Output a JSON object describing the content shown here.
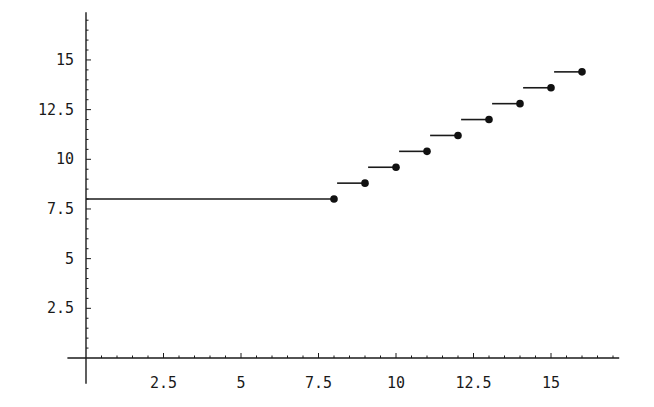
{
  "chart_data": {
    "type": "line",
    "title": "",
    "xlabel": "",
    "ylabel": "",
    "xlim": [
      -0.6,
      17.2
    ],
    "ylim": [
      -1.3,
      17.4
    ],
    "grid": false,
    "legend": null,
    "x_ticks": [
      "2.5",
      "5",
      "7.5",
      "10",
      "12.5",
      "15"
    ],
    "y_ticks": [
      "2.5",
      "5",
      "7.5",
      "10",
      "12.5",
      "15"
    ],
    "series": [
      {
        "name": "step segments",
        "style": "horizontal segments ending in filled dot",
        "segments": [
          {
            "x_start": 0,
            "x_end": 8,
            "y": 8.0
          },
          {
            "x_start": 8.1,
            "x_end": 9,
            "y": 8.8
          },
          {
            "x_start": 9.1,
            "x_end": 10,
            "y": 9.6
          },
          {
            "x_start": 10.1,
            "x_end": 11,
            "y": 10.4
          },
          {
            "x_start": 11.1,
            "x_end": 12,
            "y": 11.2
          },
          {
            "x_start": 12.1,
            "x_end": 13,
            "y": 12.0
          },
          {
            "x_start": 13.1,
            "x_end": 14,
            "y": 12.8
          },
          {
            "x_start": 14.1,
            "x_end": 15,
            "y": 13.6
          },
          {
            "x_start": 15.1,
            "x_end": 16,
            "y": 14.4
          }
        ],
        "points": {
          "x": [
            8,
            9,
            10,
            11,
            12,
            13,
            14,
            15,
            16
          ],
          "y": [
            8.0,
            8.8,
            9.6,
            10.4,
            11.2,
            12.0,
            12.8,
            13.6,
            14.4
          ]
        }
      }
    ]
  }
}
